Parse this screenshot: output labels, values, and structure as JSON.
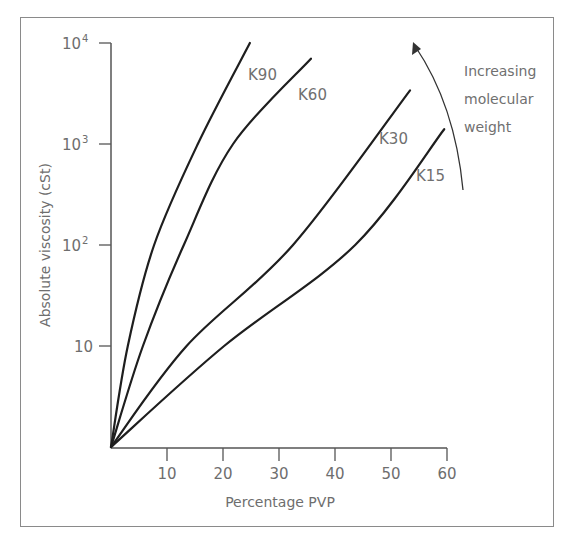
{
  "chart_data": {
    "type": "line",
    "title": "",
    "xlabel": "Percentage PVP",
    "ylabel": "Absolute viscosity (cSt)",
    "xlim": [
      0,
      60
    ],
    "ylim": [
      1,
      10000
    ],
    "yscale": "log",
    "grid": false,
    "legend": "inline labels",
    "x_ticks": [
      10,
      20,
      30,
      40,
      50,
      60
    ],
    "y_ticks": [
      {
        "value": 10,
        "label": "10"
      },
      {
        "value": 100,
        "label": "10",
        "sup": "2"
      },
      {
        "value": 1000,
        "label": "10",
        "sup": "3"
      },
      {
        "value": 10000,
        "label": "10",
        "sup": "4"
      }
    ],
    "series": [
      {
        "name": "K90",
        "points": [
          [
            0,
            1
          ],
          [
            3,
            10
          ],
          [
            7.7,
            100
          ],
          [
            15.5,
            1000
          ],
          [
            24.8,
            10000
          ]
        ]
      },
      {
        "name": "K60",
        "points": [
          [
            0,
            1
          ],
          [
            5.7,
            10
          ],
          [
            13,
            100
          ],
          [
            21.8,
            1000
          ],
          [
            35.7,
            7000
          ]
        ]
      },
      {
        "name": "K30",
        "points": [
          [
            0,
            1
          ],
          [
            13.5,
            10
          ],
          [
            32.5,
            100
          ],
          [
            53.4,
            3400
          ]
        ]
      },
      {
        "name": "K15",
        "points": [
          [
            0,
            1
          ],
          [
            20.2,
            10
          ],
          [
            43.6,
            100
          ],
          [
            59.5,
            1400
          ]
        ]
      }
    ],
    "annotations": [
      {
        "text": [
          "Increasing",
          "molecular",
          "weight"
        ],
        "arrow": "curved, pointing up"
      }
    ]
  },
  "labels": {
    "xlabel": "Percentage PVP",
    "ylabel": "Absolute viscosity (cSt)",
    "annotation_lines": [
      "Increasing",
      "molecular",
      "weight"
    ]
  }
}
